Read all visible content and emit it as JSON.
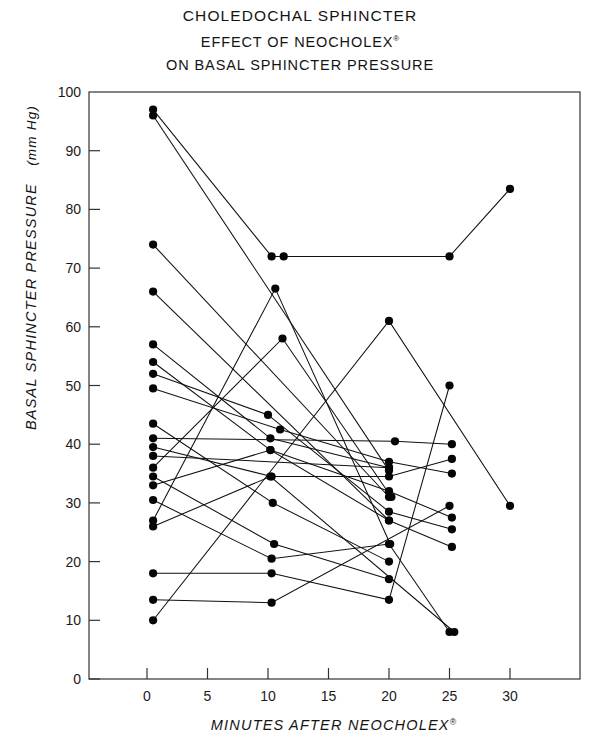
{
  "figure": {
    "title_line1": "CHOLEDOCHAL SPHINCTER",
    "title_line2_main": "EFFECT OF  NEOCHOLEX",
    "title_line2_sup": "®",
    "title_line3": "ON BASAL SPHINCTER PRESSURE"
  },
  "chart_data": {
    "type": "line",
    "xlabel": "MINUTES AFTER NEOCHOLEX®",
    "ylabel": "BASAL SPHINCTER PRESSURE  (mm Hg)",
    "xlabel_main": "MINUTES AFTER NEOCHOLEX",
    "xlabel_sup": "®",
    "ylabel_main": "BASAL SPHINCTER PRESSURE",
    "ylabel_units": "(mm Hg)",
    "xlim": [
      -1.5,
      34.5
    ],
    "ylim": [
      0,
      100
    ],
    "xticks": [
      0,
      5,
      10,
      15,
      20,
      25,
      30
    ],
    "yticks": [
      0,
      10,
      20,
      30,
      40,
      50,
      60,
      70,
      80,
      90,
      100
    ],
    "xtick_labels": [
      "0",
      "5",
      "10",
      "15",
      "20",
      "25",
      "30"
    ],
    "ytick_labels": [
      "0",
      "10",
      "20",
      "30",
      "40",
      "50",
      "60",
      "70",
      "80",
      "90",
      "100"
    ],
    "grid": false,
    "legend": "none",
    "marker": "filled-circle",
    "series_label": "individual patient tracing",
    "series": [
      {
        "name": "patient-01",
        "points": [
          [
            0.5,
            97.0
          ],
          [
            10.3,
            72.0
          ],
          [
            11.3,
            72.0
          ],
          [
            25.0,
            72.0
          ],
          [
            30.0,
            83.5
          ]
        ]
      },
      {
        "name": "patient-02",
        "points": [
          [
            0.5,
            96.0
          ],
          [
            20.0,
            35.5
          ]
        ]
      },
      {
        "name": "patient-03",
        "points": [
          [
            0.5,
            74.0
          ],
          [
            20.0,
            31.0
          ]
        ]
      },
      {
        "name": "patient-04",
        "points": [
          [
            0.5,
            66.0
          ],
          [
            20.0,
            27.0
          ]
        ]
      },
      {
        "name": "patient-05",
        "points": [
          [
            0.5,
            57.0
          ],
          [
            10.2,
            41.0
          ],
          [
            20.0,
            36.0
          ]
        ]
      },
      {
        "name": "patient-06",
        "points": [
          [
            0.5,
            54.0
          ],
          [
            10.2,
            39.0
          ],
          [
            20.0,
            32.0
          ],
          [
            25.2,
            27.5
          ]
        ]
      },
      {
        "name": "patient-07",
        "points": [
          [
            0.5,
            52.0
          ],
          [
            10.0,
            45.0
          ],
          [
            20.0,
            28.5
          ],
          [
            25.2,
            25.5
          ]
        ]
      },
      {
        "name": "patient-08",
        "points": [
          [
            0.5,
            49.5
          ],
          [
            11.0,
            42.5
          ],
          [
            20.0,
            37.0
          ],
          [
            25.2,
            35.0
          ]
        ]
      },
      {
        "name": "patient-09",
        "points": [
          [
            0.5,
            43.5
          ],
          [
            10.4,
            30.0
          ],
          [
            20.0,
            20.0
          ]
        ]
      },
      {
        "name": "patient-10",
        "points": [
          [
            0.5,
            41.0
          ],
          [
            20.5,
            40.5
          ],
          [
            25.2,
            40.0
          ]
        ]
      },
      {
        "name": "patient-11",
        "points": [
          [
            0.5,
            39.5
          ],
          [
            10.3,
            34.5
          ],
          [
            20.0,
            34.5
          ],
          [
            25.2,
            37.5
          ]
        ]
      },
      {
        "name": "patient-12",
        "points": [
          [
            0.5,
            38.0
          ],
          [
            20.0,
            36.0
          ]
        ]
      },
      {
        "name": "patient-13",
        "points": [
          [
            0.5,
            36.0
          ],
          [
            11.2,
            58.0
          ],
          [
            20.2,
            31.0
          ]
        ]
      },
      {
        "name": "patient-14",
        "points": [
          [
            0.5,
            34.5
          ],
          [
            10.5,
            23.0
          ],
          [
            20.0,
            17.0
          ]
        ]
      },
      {
        "name": "patient-15",
        "points": [
          [
            0.5,
            33.0
          ],
          [
            10.2,
            39.0
          ],
          [
            20.0,
            27.0
          ],
          [
            25.2,
            22.5
          ]
        ]
      },
      {
        "name": "patient-16",
        "points": [
          [
            0.5,
            30.5
          ],
          [
            10.3,
            20.5
          ],
          [
            20.0,
            23.0
          ],
          [
            25.0,
            8.0
          ]
        ]
      },
      {
        "name": "patient-17",
        "points": [
          [
            0.5,
            27.0
          ],
          [
            10.6,
            66.5
          ],
          [
            20.1,
            23.0
          ]
        ]
      },
      {
        "name": "patient-18",
        "points": [
          [
            0.5,
            26.0
          ],
          [
            10.2,
            34.5
          ],
          [
            25.4,
            8.0
          ]
        ]
      },
      {
        "name": "patient-19",
        "points": [
          [
            0.5,
            18.0
          ],
          [
            10.3,
            18.0
          ],
          [
            20.0,
            13.5
          ],
          [
            25.0,
            50.0
          ]
        ]
      },
      {
        "name": "patient-20",
        "points": [
          [
            0.5,
            13.5
          ],
          [
            10.3,
            13.0
          ],
          [
            25.0,
            29.5
          ]
        ]
      },
      {
        "name": "patient-21",
        "points": [
          [
            0.5,
            10.0
          ],
          [
            20.0,
            61.0
          ],
          [
            30.0,
            29.5
          ]
        ]
      }
    ]
  },
  "plot_geometry": {
    "left_px": 89,
    "right_px": 580,
    "top_px": 92,
    "bottom_px": 679,
    "x0_px": 147,
    "x_per_unit_px": 12.1,
    "y100_px": 92,
    "y_per_unit_px": 5.87
  }
}
